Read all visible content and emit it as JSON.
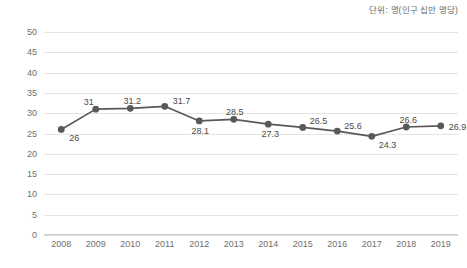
{
  "unit_note": "단위: 명(인구 십만 명당)",
  "style": {
    "line_color": "#595959",
    "marker_color": "#595959",
    "grid_color": "#e4e4e4",
    "label_color": "#6f6f6f",
    "background": "#ffffff"
  },
  "axis": {
    "y_ticks": [
      "0",
      "5",
      "10",
      "15",
      "20",
      "25",
      "30",
      "35",
      "40",
      "45",
      "50"
    ],
    "x_ticks": [
      "2008",
      "2009",
      "2010",
      "2011",
      "2012",
      "2013",
      "2014",
      "2015",
      "2016",
      "2017",
      "2018",
      "2019"
    ]
  },
  "point_labels": [
    "26",
    "31",
    "31.2",
    "31.7",
    "28.1",
    "28.5",
    "27.3",
    "26.5",
    "25.6",
    "24.3",
    "26.6",
    "26.9"
  ],
  "chart_data": {
    "type": "line",
    "title": "",
    "subtitle": "",
    "xlabel": "",
    "ylabel": "",
    "unit": "단위: 명(인구 십만 명당)",
    "categories": [
      "2008",
      "2009",
      "2010",
      "2011",
      "2012",
      "2013",
      "2014",
      "2015",
      "2016",
      "2017",
      "2018",
      "2019"
    ],
    "values": [
      26,
      31,
      31.2,
      31.7,
      28.1,
      28.5,
      27.3,
      26.5,
      25.6,
      24.3,
      26.6,
      26.9
    ],
    "ylim": [
      0,
      50
    ],
    "ytick_step": 5,
    "grid": "horizontal",
    "legend": "none",
    "markers": true,
    "data_labels": true
  }
}
